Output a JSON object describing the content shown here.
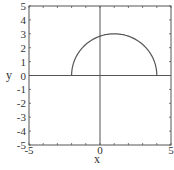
{
  "chart_data": {
    "type": "line",
    "title": "",
    "xlabel": "x",
    "ylabel": "y",
    "xlim": [
      -5,
      5
    ],
    "ylim": [
      -5,
      5
    ],
    "grid": false,
    "x_ticks": [
      "-5",
      "0",
      "5"
    ],
    "y_ticks": [
      "5",
      "4",
      "3",
      "2",
      "1",
      "0",
      "-1",
      "-2",
      "-3",
      "-4",
      "-5"
    ],
    "series": [
      {
        "name": "semicircle",
        "description": "upper half of circle centered at (1, 0) with radius 3",
        "center": [
          1,
          0
        ],
        "radius": 3,
        "x": [
          -2,
          -1.5,
          -1,
          0,
          1,
          2,
          3,
          3.5,
          4
        ],
        "y": [
          0,
          1.66,
          2.24,
          2.83,
          3,
          2.83,
          2.24,
          1.66,
          0
        ],
        "color": "#555555"
      }
    ],
    "axes_lines": {
      "x_axis_at": 0,
      "y_axis_at": 0
    }
  }
}
